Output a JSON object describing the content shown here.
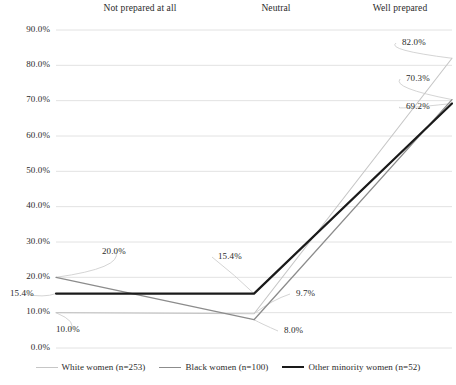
{
  "chart_data": {
    "type": "line",
    "title": "",
    "xlabel": "",
    "ylabel": "",
    "categories": [
      "Not prepared at all",
      "Neutral",
      "Well prepared"
    ],
    "ylim": [
      0,
      90
    ],
    "yticks": [
      "0.0%",
      "10.0%",
      "20.0%",
      "30.0%",
      "40.0%",
      "50.0%",
      "60.0%",
      "70.0%",
      "80.0%",
      "90.0%"
    ],
    "ytick_values": [
      0,
      10,
      20,
      30,
      40,
      50,
      60,
      70,
      80,
      90
    ],
    "grid": true,
    "grid_axis": "y",
    "legend_position": "bottom",
    "category_label_position": "top",
    "series": [
      {
        "name": "White women (n=253)",
        "values": [
          10.0,
          9.7,
          82.0
        ],
        "labels": [
          "10.0%",
          "9.7%",
          "82.0%"
        ],
        "color": "#c6c6c6",
        "width": 1.1
      },
      {
        "name": "Black women (n=100)",
        "values": [
          20.0,
          8.0,
          70.3
        ],
        "labels": [
          "20.0%",
          "8.0%",
          "70.3%"
        ],
        "color": "#8c8c8c",
        "width": 1.3
      },
      {
        "name": "Other minority women (n=52)",
        "values": [
          15.4,
          15.4,
          69.2
        ],
        "labels": [
          "15.4%",
          "15.4%",
          "69.2%"
        ],
        "color": "#1a1a1a",
        "width": 2.2
      }
    ],
    "annotations": [
      {
        "text": "20.0%",
        "series": "Black women (n=100)",
        "category": "Not prepared at all"
      },
      {
        "text": "15.4%",
        "series": "Other minority women (n=52)",
        "category": "Not prepared at all"
      },
      {
        "text": "10.0%",
        "series": "White women (n=253)",
        "category": "Not prepared at all"
      },
      {
        "text": "15.4%",
        "series": "Other minority women (n=52)",
        "category": "Neutral"
      },
      {
        "text": "9.7%",
        "series": "White women (n=253)",
        "category": "Neutral"
      },
      {
        "text": "8.0%",
        "series": "Black women (n=100)",
        "category": "Neutral"
      },
      {
        "text": "82.0%",
        "series": "White women (n=253)",
        "category": "Well prepared"
      },
      {
        "text": "70.3%",
        "series": "Black women (n=100)",
        "category": "Well prepared"
      },
      {
        "text": "69.2%",
        "series": "Other minority women (n=52)",
        "category": "Well prepared"
      }
    ]
  },
  "colors": {
    "grid": "#e2e2e2",
    "text": "#2b2b2b",
    "leader": "#cfcfcf",
    "background": "#ffffff"
  }
}
